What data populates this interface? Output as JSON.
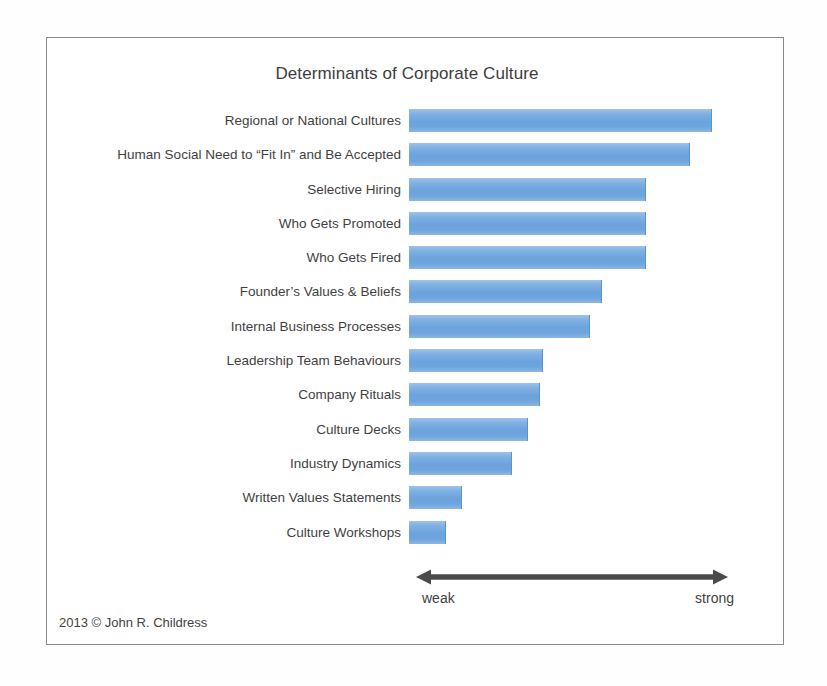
{
  "chart_data": {
    "type": "bar",
    "orientation": "horizontal",
    "title": "Determinants of Corporate Culture",
    "xlabel": "",
    "ylabel": "",
    "grid": false,
    "legend": null,
    "axis_scale": {
      "low_label": "weak",
      "high_label": "strong",
      "style": "double-headed-arrow"
    },
    "xlim": [
      0,
      100
    ],
    "categories": [
      "Regional or National Cultures",
      "Human Social Need to “Fit In” and Be Accepted",
      "Selective Hiring",
      "Who Gets Promoted",
      "Who Gets Fired",
      "Founder’s Values & Beliefs",
      "Internal Business Processes",
      "Leadership Team Behaviours",
      "Company Rituals",
      "Culture Decks",
      "Industry Dynamics",
      "Written Values Statements",
      "Culture Workshops"
    ],
    "values": [
      97,
      90,
      76,
      76,
      76,
      62,
      58,
      43,
      42,
      38,
      33,
      17,
      12
    ],
    "bar_color": "#6ba3dc",
    "title_color": "#3d3d3d",
    "label_color": "#3f3f3f",
    "arrow_color": "#4a4a4a"
  },
  "credit": {
    "text": "2013 © John R. Childress"
  }
}
